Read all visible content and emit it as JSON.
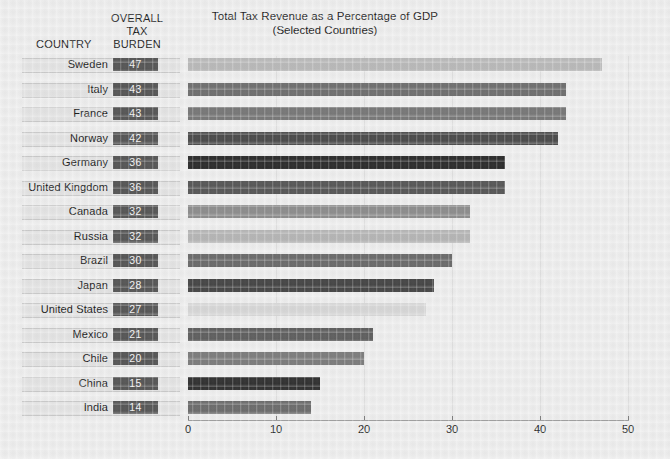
{
  "header": {
    "country_column_label": "COUNTRY",
    "burden_column_label_line1": "OVERALL",
    "burden_column_label_line2": "TAX",
    "burden_column_label_line3": "BURDEN"
  },
  "chart_data": {
    "type": "bar",
    "orientation": "horizontal",
    "title": "Total Tax Revenue as a Percentage of GDP",
    "subtitle": "(Selected Countries)",
    "xlabel": "",
    "ylabel": "",
    "xlim": [
      0,
      50
    ],
    "xticks": [
      0,
      10,
      20,
      30,
      40,
      50
    ],
    "xtick_labels": [
      "0",
      "10",
      "20",
      "30",
      "40",
      "50"
    ],
    "grid": true,
    "legend": "none",
    "categories": [
      "Sweden",
      "Italy",
      "France",
      "Norway",
      "Germany",
      "United Kingdom",
      "Canada",
      "Russia",
      "Brazil",
      "Japan",
      "United States",
      "Mexico",
      "Chile",
      "China",
      "India"
    ],
    "values": [
      47,
      43,
      43,
      42,
      36,
      36,
      32,
      32,
      30,
      28,
      27,
      21,
      20,
      15,
      14
    ],
    "value_labels": [
      "47",
      "43",
      "43",
      "42",
      "36",
      "36",
      "32",
      "32",
      "30",
      "28",
      "27",
      "21",
      "20",
      "15",
      "14"
    ],
    "bar_colors": [
      "#b8b8b8",
      "#6f6f6f",
      "#777777",
      "#4a4a4a",
      "#2b2b2b",
      "#565656",
      "#8c8c8c",
      "#b4b4b4",
      "#6a6a6a",
      "#454545",
      "#d6d6d6",
      "#5e5e5e",
      "#7c7c7c",
      "#303030",
      "#6b6b6b"
    ],
    "rows": [
      {
        "country": "Sweden",
        "value": 47,
        "label": "47",
        "color": "#b8b8b8"
      },
      {
        "country": "Italy",
        "value": 43,
        "label": "43",
        "color": "#6f6f6f"
      },
      {
        "country": "France",
        "value": 43,
        "label": "43",
        "color": "#777777"
      },
      {
        "country": "Norway",
        "value": 42,
        "label": "42",
        "color": "#4a4a4a"
      },
      {
        "country": "Germany",
        "value": 36,
        "label": "36",
        "color": "#2b2b2b"
      },
      {
        "country": "United Kingdom",
        "value": 36,
        "label": "36",
        "color": "#565656"
      },
      {
        "country": "Canada",
        "value": 32,
        "label": "32",
        "color": "#8c8c8c"
      },
      {
        "country": "Russia",
        "value": 32,
        "label": "32",
        "color": "#b4b4b4"
      },
      {
        "country": "Brazil",
        "value": 30,
        "label": "30",
        "color": "#6a6a6a"
      },
      {
        "country": "Japan",
        "value": 28,
        "label": "28",
        "color": "#454545"
      },
      {
        "country": "United States",
        "value": 27,
        "label": "27",
        "color": "#d6d6d6"
      },
      {
        "country": "Mexico",
        "value": 21,
        "label": "21",
        "color": "#5e5e5e"
      },
      {
        "country": "Chile",
        "value": 20,
        "label": "20",
        "color": "#7c7c7c"
      },
      {
        "country": "China",
        "value": 15,
        "label": "15",
        "color": "#303030"
      },
      {
        "country": "India",
        "value": 14,
        "label": "14",
        "color": "#6b6b6b"
      }
    ]
  },
  "style": {
    "background": "#ededed",
    "value_box_color": "#555555",
    "value_text_color": "#f2f2f2",
    "row_strip_color": "#e3e3e3",
    "axis_color": "#9a9a9a",
    "grid_color": "#e0e0e0"
  }
}
